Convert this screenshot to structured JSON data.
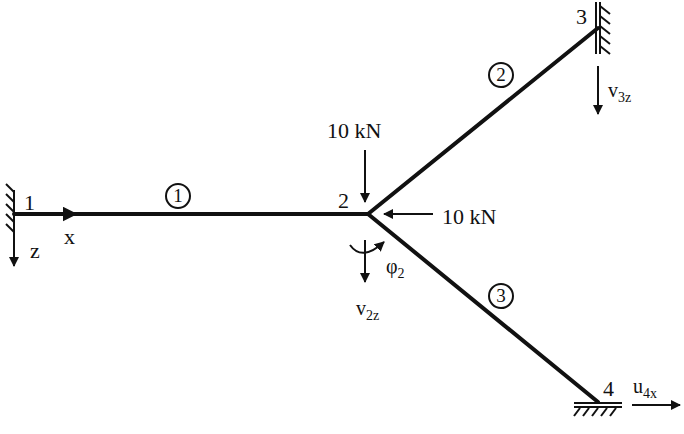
{
  "diagram": {
    "type": "plane frame / grillage structural model",
    "nodes": [
      {
        "id": "1",
        "label": "1",
        "support": "fixed (clamped, wall on left)"
      },
      {
        "id": "2",
        "label": "2",
        "support": "free joint"
      },
      {
        "id": "3",
        "label": "3",
        "support": "fixed (wall on right, vertical)"
      },
      {
        "id": "4",
        "label": "4",
        "support": "fixed (ground, horizontal)"
      }
    ],
    "members": [
      {
        "id": "1",
        "label": "1",
        "from": "1",
        "to": "2"
      },
      {
        "id": "2",
        "label": "2",
        "from": "2",
        "to": "3"
      },
      {
        "id": "3",
        "label": "3",
        "from": "2",
        "to": "4"
      }
    ],
    "loads": [
      {
        "label": "10 kN",
        "at": "2",
        "direction": "downward (z)"
      },
      {
        "label": "10 kN",
        "at": "2",
        "direction": "leftward (-x)"
      }
    ],
    "axes": {
      "x": "x",
      "z": "z"
    },
    "dofs": {
      "v2z": {
        "base": "v",
        "sub": "2z"
      },
      "phi2": {
        "base": "φ",
        "sub": "2"
      },
      "v3z": {
        "base": "v",
        "sub": "3z"
      },
      "u4x": {
        "base": "u",
        "sub": "4x"
      }
    }
  },
  "labels": {
    "node1": "1",
    "node2": "2",
    "node3": "3",
    "node4": "4",
    "member1": "1",
    "member2": "2",
    "member3": "3",
    "load_vertical": "10 kN",
    "load_horizontal": "10 kN",
    "axis_x": "x",
    "axis_z": "z"
  },
  "colors": {
    "ink": "#111111",
    "background": "#ffffff"
  }
}
